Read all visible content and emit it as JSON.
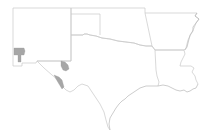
{
  "map": {
    "region": "South Central United States",
    "states": [
      "New Mexico",
      "Texas",
      "Oklahoma",
      "Arkansas",
      "Louisiana"
    ],
    "colors": {
      "background": "#ffffff",
      "border": "#c8c8c8",
      "coast": "#b8b8b8",
      "highlight": "#a6a6a6"
    },
    "highlighted_areas": [
      {
        "id": "sw-new-mexico-county",
        "state": "New Mexico"
      },
      {
        "id": "west-texas-county-north",
        "state": "Texas"
      },
      {
        "id": "west-texas-county-south",
        "state": "Texas"
      }
    ]
  }
}
